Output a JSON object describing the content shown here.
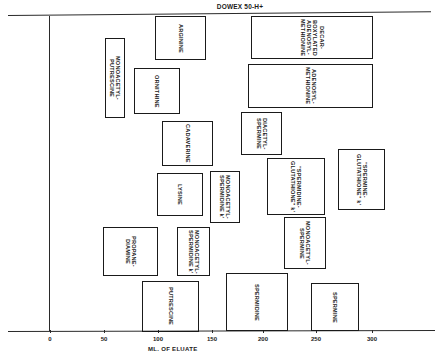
{
  "chart_data": {
    "type": "diagram",
    "title": "DOWEX 50-H+",
    "xlabel": "ML. OF ELUATE",
    "ylabel": "",
    "x_ticks": [
      "0",
      "50",
      "100",
      "150",
      "200",
      "250",
      "300"
    ],
    "xlim": [
      0,
      340
    ],
    "elution_ranges_ml": [
      {
        "name": "ARGININE",
        "start": 98,
        "end": 145
      },
      {
        "name": "DECARBOXYLATED ADENOSYL-METHIONINE",
        "start": 187,
        "end": 300
      },
      {
        "name": "MONOACETYL-PUTRESCINE",
        "start": 51,
        "end": 70
      },
      {
        "name": "ORNITHINE",
        "start": 78,
        "end": 121
      },
      {
        "name": "ADENOSYL-METHIONINE",
        "start": 184,
        "end": 300
      },
      {
        "name": "DIACETYL-SPERMINE",
        "start": 178,
        "end": 216
      },
      {
        "name": "CADAVERINE",
        "start": 104,
        "end": 152
      },
      {
        "name": "LYSINE",
        "start": 100,
        "end": 142
      },
      {
        "name": "MONOACETYL-SPERMIDINE k'",
        "start": 149,
        "end": 177
      },
      {
        "name": "\"SPERMIDINE-GLUTATHIONE\" k'",
        "start": 202,
        "end": 256
      },
      {
        "name": "\"SPERMINE-GLUTATHIONE\" k'",
        "start": 269,
        "end": 312
      },
      {
        "name": "MONOACETYL-SPERMINE",
        "start": 218,
        "end": 257
      },
      {
        "name": "PROPANE-DIAMINE",
        "start": 50,
        "end": 101
      },
      {
        "name": "MONOACETYL-SPERMIDINE k'",
        "start": 118,
        "end": 149
      },
      {
        "name": "PUTRESCINE",
        "start": 86,
        "end": 139
      },
      {
        "name": "SPERMIDINE",
        "start": 163,
        "end": 220
      },
      {
        "name": "SPERMINE",
        "start": 241,
        "end": 286
      }
    ],
    "grid": false,
    "legend": "none"
  },
  "header": {
    "resin": "DOWEX 50-H+"
  },
  "axis": {
    "xlabel": "ML. OF ELUATE",
    "ticks": [
      {
        "label": "0",
        "x": 50
      },
      {
        "label": "50",
        "x": 104
      },
      {
        "label": "100",
        "x": 158
      },
      {
        "label": "150",
        "x": 212
      },
      {
        "label": "200",
        "x": 263
      },
      {
        "label": "250",
        "x": 316
      },
      {
        "label": "300",
        "x": 372
      }
    ]
  },
  "boxes": [
    {
      "label": "ARGININE",
      "x": 155,
      "y": 16,
      "w": 51,
      "h": 44
    },
    {
      "label": "DECAR-\nBOXYLATED\nADENOSYL-\nMETHIONINE",
      "x": 251,
      "y": 16,
      "w": 122,
      "h": 43
    },
    {
      "label": "MONOACETYL-\nPUTRESCINE",
      "x": 105,
      "y": 38,
      "w": 20,
      "h": 80
    },
    {
      "label": "ORNITHINE",
      "x": 134,
      "y": 68,
      "w": 46,
      "h": 46
    },
    {
      "label": "ADENOSYL-\nMETHIONINE",
      "x": 248,
      "y": 64,
      "w": 125,
      "h": 44
    },
    {
      "label": "DIACETYL-\nSPERMINE",
      "x": 241,
      "y": 112,
      "w": 41,
      "h": 43
    },
    {
      "label": "CADAVERINE",
      "x": 162,
      "y": 121,
      "w": 51,
      "h": 45
    },
    {
      "label": "LYSINE",
      "x": 157,
      "y": 173,
      "w": 46,
      "h": 43
    },
    {
      "label": "MONOACETYL-\nSPERMIDINE k'",
      "x": 210,
      "y": 171,
      "w": 30,
      "h": 52
    },
    {
      "label": "\"SPERMIDINE-\nGLUTATHIONE\" k'",
      "x": 267,
      "y": 158,
      "w": 58,
      "h": 57
    },
    {
      "label": "\"SPERMINE-\nGLUTATHIONE\" k'",
      "x": 338,
      "y": 149,
      "w": 47,
      "h": 61
    },
    {
      "label": "MONOACETYL-\nSPERMINE",
      "x": 284,
      "y": 217,
      "w": 42,
      "h": 52
    },
    {
      "label": "PROPANE-\nDIAMINE",
      "x": 103,
      "y": 227,
      "w": 55,
      "h": 49
    },
    {
      "label": "MONOACETYL-\nSPERMIDINE k'",
      "x": 177,
      "y": 227,
      "w": 33,
      "h": 49
    },
    {
      "label": "PUTRESCINE",
      "x": 142,
      "y": 281,
      "w": 57,
      "h": 51
    },
    {
      "label": "SPERMIDINE",
      "x": 226,
      "y": 273,
      "w": 62,
      "h": 58
    },
    {
      "label": "SPERMINE",
      "x": 311,
      "y": 283,
      "w": 48,
      "h": 48
    }
  ]
}
